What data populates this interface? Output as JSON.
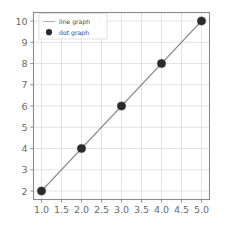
{
  "chart_data": {
    "type": "line",
    "title": "",
    "xlabel": "",
    "ylabel": "",
    "x": [
      1,
      2,
      3,
      4,
      5
    ],
    "series": [
      {
        "name": "line graph",
        "values": [
          2,
          4,
          6,
          8,
          10
        ],
        "style": "line",
        "color": "#8c8c8c"
      },
      {
        "name": "dot graph",
        "values": [
          2,
          4,
          6,
          8,
          10
        ],
        "style": "marker",
        "color": "#2b2b2b"
      }
    ],
    "xlim": [
      0.8,
      5.2
    ],
    "ylim": [
      1.6,
      10.4
    ],
    "xticks": [
      1.0,
      1.5,
      2.0,
      2.5,
      3.0,
      3.5,
      4.0,
      4.5,
      5.0
    ],
    "xtick_labels": [
      "1.0",
      "1.5",
      "2.0",
      "2.5",
      "3.0",
      "3.5",
      "4.0",
      "4.5",
      "5.0"
    ],
    "yticks": [
      2,
      3,
      4,
      5,
      6,
      7,
      8,
      9,
      10
    ],
    "ytick_labels": [
      "2",
      "3",
      "4",
      "5",
      "6",
      "7",
      "8",
      "9",
      "10"
    ],
    "grid": true,
    "legend_position": "upper left",
    "legend_entries": [
      {
        "label": "line graph",
        "marker": "line"
      },
      {
        "label": "dot graph",
        "marker": "circle"
      }
    ],
    "colors": {
      "background": "#ffffff",
      "grid": "#d9d9d9",
      "spine": "#8a8a8a",
      "tick_text": "#6b6b6b",
      "line": "#8c8c8c",
      "marker": "#2b2b2b"
    }
  }
}
